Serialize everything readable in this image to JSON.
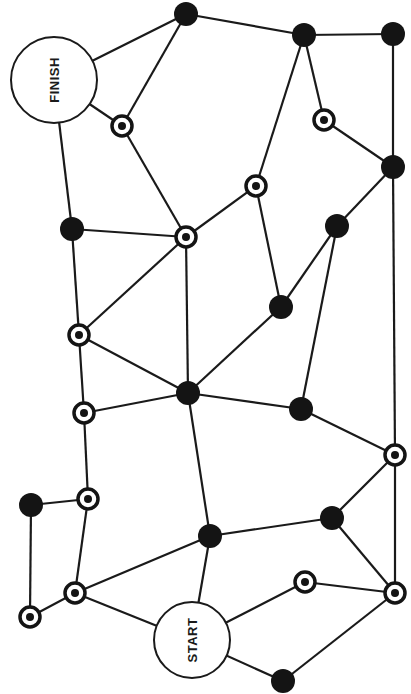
{
  "board": {
    "title": "Path board game",
    "colors": {
      "ink": "#141414",
      "background": "#ffffff"
    },
    "special_spaces": [
      {
        "id": "finish",
        "label": "FINISH"
      },
      {
        "id": "start",
        "label": "START"
      }
    ],
    "spaces": [
      {
        "id": "A",
        "type": "black"
      },
      {
        "id": "B",
        "type": "black"
      },
      {
        "id": "C",
        "type": "black"
      },
      {
        "id": "D",
        "type": "target"
      },
      {
        "id": "E",
        "type": "black"
      },
      {
        "id": "F",
        "type": "target"
      },
      {
        "id": "G",
        "type": "black"
      },
      {
        "id": "H",
        "type": "target"
      },
      {
        "id": "I",
        "type": "black"
      },
      {
        "id": "J",
        "type": "target"
      },
      {
        "id": "K",
        "type": "target"
      },
      {
        "id": "L",
        "type": "black"
      },
      {
        "id": "M",
        "type": "target"
      },
      {
        "id": "N",
        "type": "black"
      },
      {
        "id": "O",
        "type": "black"
      },
      {
        "id": "P",
        "type": "target"
      },
      {
        "id": "Q",
        "type": "black"
      },
      {
        "id": "R",
        "type": "target"
      },
      {
        "id": "S",
        "type": "target"
      },
      {
        "id": "T",
        "type": "target"
      },
      {
        "id": "U",
        "type": "black"
      },
      {
        "id": "V",
        "type": "black"
      },
      {
        "id": "W",
        "type": "target"
      },
      {
        "id": "X",
        "type": "target"
      },
      {
        "id": "Y",
        "type": "black"
      }
    ],
    "connections": [
      [
        "finish",
        "A"
      ],
      [
        "finish",
        "H"
      ],
      [
        "finish",
        "I"
      ],
      [
        "A",
        "B"
      ],
      [
        "A",
        "H"
      ],
      [
        "B",
        "C"
      ],
      [
        "B",
        "D"
      ],
      [
        "B",
        "F"
      ],
      [
        "C",
        "E"
      ],
      [
        "D",
        "E"
      ],
      [
        "E",
        "G"
      ],
      [
        "E",
        "P"
      ],
      [
        "F",
        "J"
      ],
      [
        "F",
        "N"
      ],
      [
        "G",
        "N"
      ],
      [
        "G",
        "O"
      ],
      [
        "H",
        "J"
      ],
      [
        "I",
        "J"
      ],
      [
        "I",
        "K"
      ],
      [
        "J",
        "K"
      ],
      [
        "J",
        "L"
      ],
      [
        "K",
        "L"
      ],
      [
        "K",
        "M"
      ],
      [
        "L",
        "M"
      ],
      [
        "L",
        "N"
      ],
      [
        "L",
        "O"
      ],
      [
        "L",
        "U"
      ],
      [
        "M",
        "R"
      ],
      [
        "O",
        "P"
      ],
      [
        "P",
        "V"
      ],
      [
        "P",
        "X"
      ],
      [
        "Q",
        "R"
      ],
      [
        "Q",
        "T"
      ],
      [
        "R",
        "S"
      ],
      [
        "S",
        "T"
      ],
      [
        "S",
        "U"
      ],
      [
        "S",
        "start"
      ],
      [
        "U",
        "V"
      ],
      [
        "U",
        "start"
      ],
      [
        "V",
        "X"
      ],
      [
        "W",
        "X"
      ],
      [
        "W",
        "start"
      ],
      [
        "X",
        "Y"
      ],
      [
        "Y",
        "start"
      ]
    ]
  }
}
